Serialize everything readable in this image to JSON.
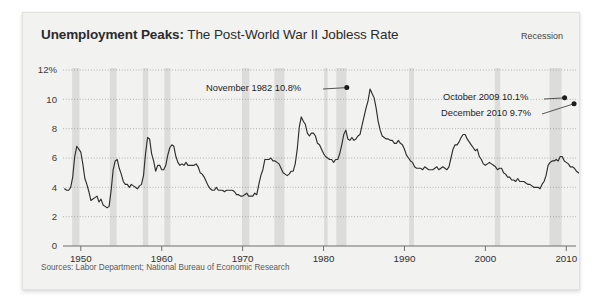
{
  "card": {
    "title_bold": "Unemployment Peaks:",
    "title_rest": " The Post-World War II Jobless Rate",
    "legend_label": "Recession",
    "sources": "Sources: Labor Department; National Bureau of Economic Research"
  },
  "annotations": [
    {
      "id": "peak-1982",
      "text": "November 1982 10.8%",
      "year": 1982.87,
      "value": 10.8
    },
    {
      "id": "peak-2009",
      "text": "October 2009 10.1%",
      "year": 2009.79,
      "value": 10.1
    },
    {
      "id": "peak-2010",
      "text": "December 2010 9.7%",
      "year": 2010.96,
      "value": 9.7
    }
  ],
  "colors": {
    "card_bg": "#f2f2f0",
    "line": "#2e2e2e",
    "recession_band": "#dcdcda",
    "gridline": "#8a8a8a",
    "axis": "#6f6f6f",
    "title": "#2b2b2b",
    "source_text": "#5a5a5a"
  },
  "chart_data": {
    "type": "line",
    "title": "Unemployment Peaks: The Post-World War II Jobless Rate",
    "xlabel": "",
    "ylabel": "",
    "xlim": [
      1947.8,
      2011.2
    ],
    "ylim": [
      0,
      12
    ],
    "ytick_labels": [
      "0",
      "2",
      "4",
      "6",
      "8",
      "10",
      "12%"
    ],
    "yticks": [
      0,
      2,
      4,
      6,
      8,
      10,
      12
    ],
    "xticks": [
      1950,
      1960,
      1970,
      1980,
      1990,
      2000,
      2010
    ],
    "xtick_labels": [
      "1950",
      "1960",
      "1970",
      "1980",
      "1990",
      "2000",
      "2010"
    ],
    "grid": "horizontal-dotted",
    "legend": "Recession",
    "legend_position": "top-right",
    "series": [
      {
        "name": "US civilian unemployment rate (%)",
        "x_start": 1948.0,
        "x_step": 0.25,
        "values": [
          3.9,
          3.8,
          3.8,
          4.0,
          4.7,
          6.1,
          6.8,
          6.6,
          6.4,
          5.6,
          4.6,
          4.2,
          3.7,
          3.1,
          3.2,
          3.3,
          3.4,
          3.0,
          3.2,
          2.8,
          2.7,
          2.6,
          2.7,
          3.8,
          5.2,
          5.8,
          5.9,
          5.3,
          4.9,
          4.4,
          4.2,
          4.2,
          4.0,
          4.2,
          4.1,
          4.0,
          3.9,
          4.1,
          4.2,
          4.8,
          6.3,
          7.4,
          7.3,
          6.3,
          5.8,
          5.1,
          5.5,
          5.5,
          5.2,
          5.2,
          5.5,
          6.2,
          6.7,
          6.9,
          6.8,
          6.1,
          5.7,
          5.5,
          5.6,
          5.5,
          5.7,
          5.5,
          5.5,
          5.5,
          5.5,
          5.6,
          5.4,
          5.0,
          4.9,
          4.7,
          4.4,
          4.1,
          3.9,
          3.8,
          3.8,
          4.0,
          3.8,
          3.8,
          3.8,
          3.7,
          3.8,
          3.8,
          3.8,
          3.8,
          3.7,
          3.5,
          3.5,
          3.4,
          3.4,
          3.5,
          3.6,
          3.4,
          3.4,
          3.4,
          3.6,
          3.5,
          4.2,
          4.8,
          5.2,
          5.9,
          5.9,
          5.9,
          6.0,
          5.8,
          5.8,
          5.7,
          5.6,
          5.3,
          5.0,
          4.9,
          4.8,
          4.9,
          5.1,
          5.1,
          5.6,
          6.6,
          8.1,
          8.8,
          8.5,
          8.3,
          7.7,
          7.5,
          7.7,
          7.7,
          7.5,
          7.0,
          6.9,
          6.6,
          6.3,
          6.1,
          6.0,
          5.9,
          5.9,
          5.7,
          5.9,
          5.9,
          6.3,
          6.9,
          7.6,
          7.9,
          7.3,
          7.2,
          7.4,
          7.2,
          7.3,
          7.5,
          7.6,
          8.2,
          8.8,
          9.4,
          9.9,
          10.7,
          10.4,
          10.1,
          9.4,
          8.5,
          7.9,
          7.5,
          7.4,
          7.3,
          7.3,
          7.2,
          7.2,
          7.0,
          7.0,
          7.2,
          7.0,
          6.9,
          6.6,
          6.2,
          6.0,
          5.8,
          5.7,
          5.4,
          5.3,
          5.3,
          5.3,
          5.2,
          5.4,
          5.3,
          5.2,
          5.2,
          5.2,
          5.3,
          5.4,
          5.2,
          5.3,
          5.4,
          5.3,
          5.2,
          5.4,
          6.0,
          6.6,
          6.9,
          6.9,
          7.1,
          7.4,
          7.6,
          7.6,
          7.3,
          7.1,
          6.9,
          6.7,
          6.5,
          6.6,
          6.1,
          5.9,
          5.6,
          5.5,
          5.6,
          5.7,
          5.6,
          5.5,
          5.4,
          5.2,
          5.3,
          5.3,
          5.0,
          4.9,
          4.7,
          4.7,
          4.5,
          4.5,
          4.4,
          4.6,
          4.4,
          4.4,
          4.4,
          4.3,
          4.2,
          4.2,
          4.1,
          4.0,
          4.0,
          4.0,
          3.9,
          4.2,
          4.4,
          4.8,
          5.5,
          5.7,
          5.8,
          5.8,
          5.9,
          5.8,
          6.1,
          6.1,
          5.8,
          5.7,
          5.6,
          5.4,
          5.4,
          5.3,
          5.1,
          5.0,
          4.9,
          4.7,
          4.6,
          4.7,
          4.4,
          4.5,
          4.5,
          4.6,
          4.8,
          5.0,
          5.4,
          6.1,
          7.0,
          8.3,
          9.3,
          9.6,
          9.9,
          9.8,
          9.6,
          9.5,
          9.6
        ]
      }
    ],
    "recession_bands": [
      {
        "start": 1948.92,
        "end": 1949.83
      },
      {
        "start": 1953.58,
        "end": 1954.42
      },
      {
        "start": 1957.67,
        "end": 1958.33
      },
      {
        "start": 1960.33,
        "end": 1961.08
      },
      {
        "start": 1969.92,
        "end": 1970.83
      },
      {
        "start": 1973.92,
        "end": 1975.17
      },
      {
        "start": 1980.08,
        "end": 1980.5
      },
      {
        "start": 1981.58,
        "end": 1982.83
      },
      {
        "start": 1990.58,
        "end": 1991.17
      },
      {
        "start": 2001.17,
        "end": 2001.83
      },
      {
        "start": 2007.92,
        "end": 2009.42
      }
    ]
  }
}
